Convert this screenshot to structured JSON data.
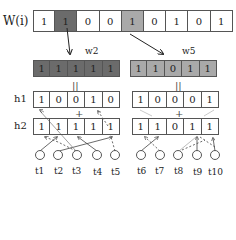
{
  "colors": {
    "dark_highlight": "#6b6b6b",
    "light_highlight": "#a9a9a9",
    "border": "#555555"
  },
  "w_row": {
    "label": "W(i)",
    "cells": [
      "1",
      "1",
      "0",
      "0",
      "1",
      "0",
      "1",
      "0",
      "1"
    ],
    "highlight_dark_index": 1,
    "highlight_light_index": 4
  },
  "blocks": [
    {
      "label": "w2",
      "cells": [
        "1",
        "1",
        "1",
        "1",
        "1"
      ],
      "equals": "||",
      "h1": {
        "label": "h1",
        "cells": [
          "1",
          "0",
          "0",
          "1",
          "0"
        ]
      },
      "plus": "+",
      "h2": {
        "label": "h2",
        "cells": [
          "1",
          "1",
          "1",
          "1",
          "1"
        ]
      },
      "terms": [
        "t1",
        "t2",
        "t3",
        "t4",
        "t5"
      ]
    },
    {
      "label": "w5",
      "cells": [
        "1",
        "1",
        "0",
        "1",
        "1"
      ],
      "equals": "||",
      "h1": {
        "cells": [
          "1",
          "0",
          "0",
          "0",
          "1"
        ]
      },
      "plus": "+",
      "h2": {
        "cells": [
          "1",
          "1",
          "0",
          "1",
          "1"
        ]
      },
      "terms": [
        "t6",
        "t7",
        "t8",
        "t9",
        "t10"
      ]
    }
  ]
}
